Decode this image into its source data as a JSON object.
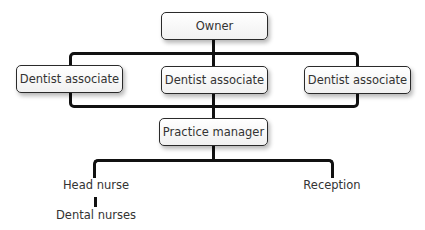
{
  "diagram": {
    "type": "org-chart",
    "nodes": {
      "owner": "Owner",
      "associates": [
        "Dentist associate",
        "Dentist associate",
        "Dentist associate"
      ],
      "practice_manager": "Practice manager",
      "head_nurse": "Head nurse",
      "dental_nurses": "Dental nurses",
      "reception": "Reception"
    },
    "edges": [
      [
        "Owner",
        "Dentist associate (left)"
      ],
      [
        "Owner",
        "Dentist associate (center)"
      ],
      [
        "Owner",
        "Dentist associate (right)"
      ],
      [
        "Dentist associates",
        "Practice manager"
      ],
      [
        "Practice manager",
        "Head nurse"
      ],
      [
        "Practice manager",
        "Reception"
      ],
      [
        "Head nurse",
        "Dental nurses"
      ]
    ],
    "colors": {
      "line": "#111111",
      "node_border": "#2a2a2a",
      "node_fill": "#ffffff",
      "text": "#333333"
    }
  }
}
